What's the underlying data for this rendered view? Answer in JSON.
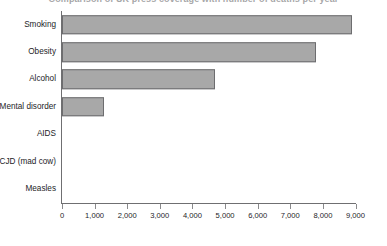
{
  "chart_data": {
    "type": "bar",
    "orientation": "horizontal",
    "title": "Comparison of UK press coverage with number of deaths per year",
    "xlabel": "",
    "ylabel": "",
    "categories": [
      "Smoking",
      "Obesity",
      "Alcohol",
      "Mental disorder",
      "AIDS",
      "vCJD (mad cow)",
      "Measles"
    ],
    "values": [
      8900,
      7800,
      4700,
      1300,
      0,
      0,
      0
    ],
    "xlim": [
      0,
      9000
    ],
    "xticks": [
      0,
      1000,
      2000,
      3000,
      4000,
      5000,
      6000,
      7000,
      8000,
      9000
    ],
    "xtick_labels": [
      "0",
      "1,000",
      "2,000",
      "3,000",
      "4,000",
      "5,000",
      "6,000",
      "7,000",
      "8,000",
      "9,000"
    ],
    "grid": false,
    "legend": null,
    "bar_fill_color": "#a8a8a8",
    "bar_border_color": "#6d6d6f",
    "axis_color": "#6f6f71",
    "background_color": "#ffffff"
  }
}
